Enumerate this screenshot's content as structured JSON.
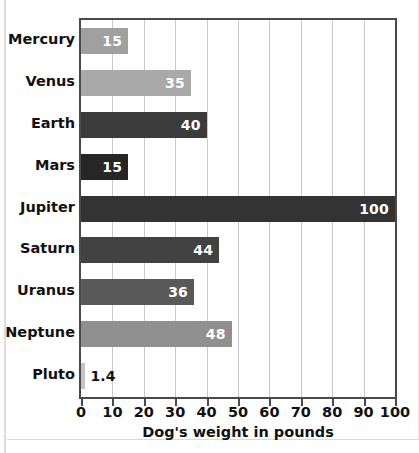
{
  "chart_data": {
    "type": "bar",
    "orientation": "horizontal",
    "title": "",
    "xlabel": "Dog's weight in pounds",
    "ylabel": "",
    "xlim": [
      0,
      100
    ],
    "xticks": [
      "0",
      "10",
      "20",
      "30",
      "40",
      "50",
      "60",
      "70",
      "80",
      "90",
      "100"
    ],
    "grid": "vertical",
    "legend": "none",
    "categories": [
      "Mercury",
      "Venus",
      "Earth",
      "Mars",
      "Jupiter",
      "Saturn",
      "Uranus",
      "Neptune",
      "Pluto"
    ],
    "values": [
      15,
      35,
      40,
      15,
      100,
      44,
      36,
      48,
      1.4
    ],
    "value_labels": [
      "15",
      "35",
      "40",
      "15",
      "100",
      "44",
      "36",
      "48",
      "1.4"
    ],
    "bar_colors": [
      "#a0a0a0",
      "#a9a9a9",
      "#3b3b3b",
      "#262626",
      "#333333",
      "#424242",
      "#595959",
      "#909090",
      "#c4c4c4"
    ],
    "label_inside": [
      true,
      true,
      true,
      true,
      true,
      true,
      true,
      true,
      false
    ],
    "bars": [
      {
        "category": "Mercury",
        "value": 15,
        "label": "15",
        "color": "#a0a0a0",
        "label_inside": true
      },
      {
        "category": "Venus",
        "value": 35,
        "label": "35",
        "color": "#a9a9a9",
        "label_inside": true
      },
      {
        "category": "Earth",
        "value": 40,
        "label": "40",
        "color": "#3b3b3b",
        "label_inside": true
      },
      {
        "category": "Mars",
        "value": 15,
        "label": "15",
        "color": "#262626",
        "label_inside": true
      },
      {
        "category": "Jupiter",
        "value": 100,
        "label": "100",
        "color": "#333333",
        "label_inside": true
      },
      {
        "category": "Saturn",
        "value": 44,
        "label": "44",
        "color": "#424242",
        "label_inside": true
      },
      {
        "category": "Uranus",
        "value": 36,
        "label": "36",
        "color": "#595959",
        "label_inside": true
      },
      {
        "category": "Neptune",
        "value": 48,
        "label": "48",
        "color": "#909090",
        "label_inside": true
      },
      {
        "category": "Pluto",
        "value": 1.4,
        "label": "1.4",
        "color": "#c4c4c4",
        "label_inside": false
      }
    ]
  },
  "style": {
    "axis_color": "#4a4a4a",
    "grid_color": "#c9c9c9",
    "text_color": "#111111",
    "inside_label_color": "#ffffff",
    "background": "#ffffff"
  }
}
